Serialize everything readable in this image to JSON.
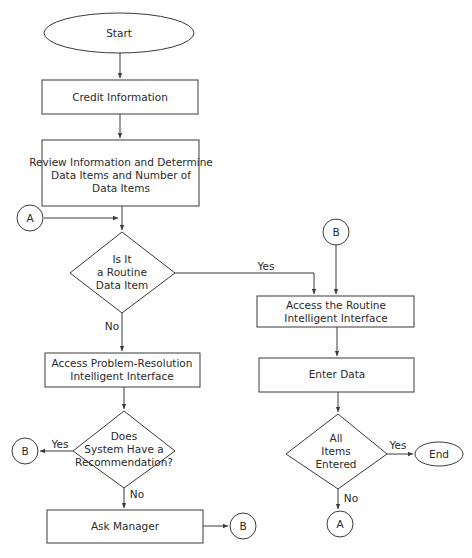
{
  "diagram": {
    "type": "flowchart",
    "nodes": {
      "start": {
        "label": "Start",
        "shape": "ellipse"
      },
      "credit_info": {
        "label": "Credit Information",
        "shape": "process"
      },
      "review": {
        "lines": [
          "Review Information and Determine",
          "Data Items and Number of",
          "Data Items"
        ],
        "shape": "process"
      },
      "connector_a_in": {
        "label": "A",
        "shape": "connector"
      },
      "routine_decision": {
        "lines": [
          "Is It",
          "a Routine",
          "Data Item"
        ],
        "shape": "decision"
      },
      "problem_resolution": {
        "lines": [
          "Access Problem-Resolution",
          "Intelligent Interface"
        ],
        "shape": "process"
      },
      "recommendation_decision": {
        "lines": [
          "Does",
          "System Have a",
          "Recommendation?"
        ],
        "shape": "decision"
      },
      "connector_b_yes": {
        "label": "B",
        "shape": "connector"
      },
      "ask_manager": {
        "label": "Ask Manager",
        "shape": "process"
      },
      "connector_b_manager": {
        "label": "B",
        "shape": "connector"
      },
      "connector_b_in": {
        "label": "B",
        "shape": "connector"
      },
      "routine_interface": {
        "lines": [
          "Access the Routine",
          "Intelligent Interface"
        ],
        "shape": "process"
      },
      "enter_data": {
        "label": "Enter Data",
        "shape": "process"
      },
      "all_entered_decision": {
        "lines": [
          "All",
          "Items",
          "Entered"
        ],
        "shape": "decision"
      },
      "end": {
        "label": "End",
        "shape": "ellipse"
      },
      "connector_a_out": {
        "label": "A",
        "shape": "connector"
      }
    },
    "edge_labels": {
      "routine_yes": "Yes",
      "routine_no": "No",
      "recommendation_yes": "Yes",
      "recommendation_no": "No",
      "all_entered_yes": "Yes",
      "all_entered_no": "No"
    },
    "edges": [
      {
        "from": "start",
        "to": "credit_info"
      },
      {
        "from": "credit_info",
        "to": "review"
      },
      {
        "from": "review",
        "to": "routine_decision"
      },
      {
        "from": "connector_a_in",
        "to": "routine_decision"
      },
      {
        "from": "routine_decision",
        "to": "routine_interface",
        "label": "Yes"
      },
      {
        "from": "routine_decision",
        "to": "problem_resolution",
        "label": "No"
      },
      {
        "from": "problem_resolution",
        "to": "recommendation_decision"
      },
      {
        "from": "recommendation_decision",
        "to": "connector_b_yes",
        "label": "Yes"
      },
      {
        "from": "recommendation_decision",
        "to": "ask_manager",
        "label": "No"
      },
      {
        "from": "ask_manager",
        "to": "connector_b_manager"
      },
      {
        "from": "connector_b_in",
        "to": "routine_interface"
      },
      {
        "from": "routine_interface",
        "to": "enter_data"
      },
      {
        "from": "enter_data",
        "to": "all_entered_decision"
      },
      {
        "from": "all_entered_decision",
        "to": "end",
        "label": "Yes"
      },
      {
        "from": "all_entered_decision",
        "to": "connector_a_out",
        "label": "No"
      }
    ]
  }
}
